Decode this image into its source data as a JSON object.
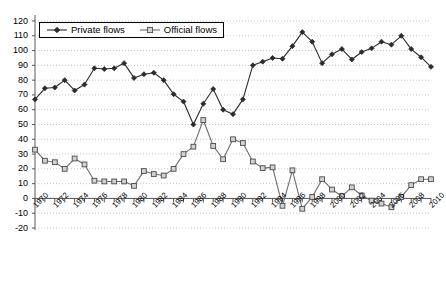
{
  "chart_data": {
    "type": "line",
    "title": "",
    "xlabel": "",
    "ylabel": "",
    "xlim": [
      1970,
      2010
    ],
    "ylim": [
      -20,
      120
    ],
    "yticks": [
      -20,
      -10,
      0,
      10,
      20,
      30,
      40,
      50,
      60,
      70,
      80,
      90,
      100,
      110,
      120
    ],
    "ytick_labels": [
      "-20",
      "-10",
      "0",
      "10",
      "20",
      "30",
      "40",
      "50",
      "60",
      "70",
      "80",
      "90",
      "100",
      "110",
      "120"
    ],
    "xticks": [
      1970,
      1971,
      1972,
      1973,
      1974,
      1975,
      1976,
      1977,
      1978,
      1979,
      1980,
      1981,
      1982,
      1983,
      1984,
      1985,
      1986,
      1987,
      1988,
      1989,
      1990,
      1991,
      1992,
      1993,
      1994,
      1995,
      1996,
      1997,
      1998,
      1999,
      2000,
      2001,
      2002,
      2003,
      2004,
      2005,
      2006,
      2007,
      2008,
      2009,
      2010
    ],
    "xtick_labels": [
      "1970",
      "1972",
      "1974",
      "1976",
      "1978",
      "1980",
      "1982",
      "1984",
      "1986",
      "1988",
      "1990",
      "1992",
      "1994",
      "1996",
      "1998",
      "2000",
      "2002",
      "2004",
      "2006",
      "2008",
      "2010"
    ],
    "xtick_label_years": [
      1970,
      1972,
      1974,
      1976,
      1978,
      1980,
      1982,
      1984,
      1986,
      1988,
      1990,
      1992,
      1994,
      1996,
      1998,
      2000,
      2002,
      2004,
      2006,
      2008,
      2010
    ],
    "grid": true,
    "grid_style": "dotted",
    "legend_position": "top-left",
    "x": [
      1970,
      1971,
      1972,
      1973,
      1974,
      1975,
      1976,
      1977,
      1978,
      1979,
      1980,
      1981,
      1982,
      1983,
      1984,
      1985,
      1986,
      1987,
      1988,
      1989,
      1990,
      1991,
      1992,
      1993,
      1994,
      1995,
      1996,
      1997,
      1998,
      1999,
      2000,
      2001,
      2002,
      2003,
      2004,
      2005,
      2006,
      2007,
      2008,
      2009,
      2010
    ],
    "series": [
      {
        "name": "Private flows",
        "marker": "diamond",
        "color": "#2b2b2b",
        "values": [
          67,
          74.5,
          75,
          80,
          73,
          77,
          88,
          87.5,
          88,
          91.5,
          81.5,
          84,
          85,
          80,
          70.5,
          65.5,
          50,
          64,
          74,
          60,
          57,
          67,
          90,
          92.5,
          95,
          94.5,
          103,
          112.5,
          106,
          91.5,
          97.5,
          101,
          94,
          99,
          101.5,
          106,
          104,
          110,
          101,
          95.5,
          89
        ]
      },
      {
        "name": "Official flows",
        "marker": "square",
        "color": "#6e6e6e",
        "values": [
          33,
          25.5,
          24.5,
          20,
          27,
          23,
          12,
          11.5,
          11.5,
          11.5,
          8.5,
          18.5,
          16.5,
          15.5,
          20,
          30,
          35,
          53,
          35.5,
          26.5,
          40,
          37.5,
          25,
          20.5,
          21,
          -5,
          19,
          -7,
          1,
          13,
          6,
          1.5,
          7.5,
          2,
          -1.5,
          -3.5,
          -6,
          1,
          9,
          13,
          13
        ]
      }
    ]
  },
  "legend": {
    "items": [
      {
        "label": "Private flows",
        "marker": "diamond"
      },
      {
        "label": "Official flows",
        "marker": "square"
      }
    ]
  }
}
